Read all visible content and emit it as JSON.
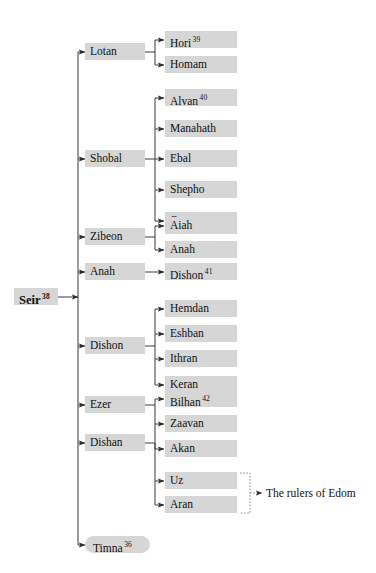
{
  "diagram": {
    "colors": {
      "node_fill": "#d6d6d6",
      "line": "#3a3a3a",
      "dotted_line": "#8a8a8a",
      "text": "#111111",
      "background": "#ffffff"
    },
    "root": {
      "label": "Seir",
      "superscript": "38"
    },
    "children": [
      {
        "label": "Lotan",
        "superscript": "",
        "children": [
          {
            "label": "Hori",
            "superscript": "39"
          },
          {
            "label": "Homam",
            "superscript": ""
          }
        ]
      },
      {
        "label": "Shobal",
        "superscript": "",
        "children": [
          {
            "label": "Alvan",
            "superscript": "40"
          },
          {
            "label": "Manahath",
            "superscript": ""
          },
          {
            "label": "Ebal",
            "superscript": ""
          },
          {
            "label": "Shepho",
            "superscript": ""
          },
          {
            "label": "Onam",
            "superscript": ""
          }
        ]
      },
      {
        "label": "Zibeon",
        "superscript": "",
        "children": [
          {
            "label": "Aiah",
            "superscript": ""
          },
          {
            "label": "Anah",
            "superscript": ""
          }
        ]
      },
      {
        "label": "Anah",
        "superscript": "",
        "children": [
          {
            "label": "Dishon",
            "superscript": "41"
          }
        ]
      },
      {
        "label": "Dishon",
        "superscript": "",
        "children": [
          {
            "label": "Hemdan",
            "superscript": ""
          },
          {
            "label": "Eshban",
            "superscript": ""
          },
          {
            "label": "Ithran",
            "superscript": ""
          },
          {
            "label": "Keran",
            "superscript": ""
          }
        ]
      },
      {
        "label": "Ezer",
        "superscript": "",
        "children": [
          {
            "label": "Bilhan",
            "superscript": "42"
          },
          {
            "label": "Zaavan",
            "superscript": ""
          },
          {
            "label": "Akan",
            "superscript": ""
          }
        ]
      },
      {
        "label": "Dishan",
        "superscript": "",
        "children": [
          {
            "label": "Uz",
            "superscript": ""
          },
          {
            "label": "Aran",
            "superscript": ""
          }
        ]
      },
      {
        "label": "Timna",
        "superscript": "36",
        "shape": "pill",
        "children": []
      }
    ],
    "annotation": {
      "label": "The rulers of Edom",
      "source_nodes": [
        "Uz",
        "Aran"
      ]
    }
  }
}
